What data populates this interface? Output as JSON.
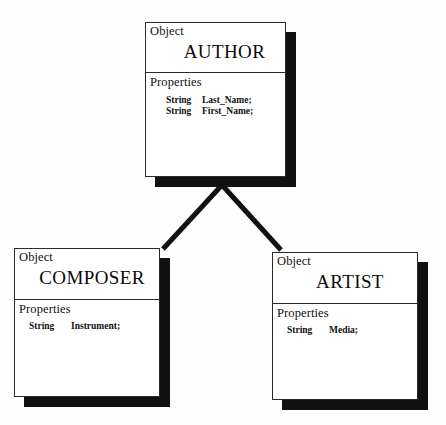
{
  "diagram": {
    "type": "class-diagram",
    "background_color": "#fefefe",
    "line_color": "#111111",
    "box_fill": "#ffffff",
    "border_color": "#2a2a2a",
    "shadow_color": "#111111",
    "classes": [
      {
        "id": "author",
        "stereotype": "Object",
        "name": "AUTHOR",
        "section_label": "Properties",
        "properties": [
          {
            "type": "String",
            "name": "Last_Name;"
          },
          {
            "type": "String",
            "name": "First_Name;"
          }
        ]
      },
      {
        "id": "composer",
        "stereotype": "Object",
        "name": "COMPOSER",
        "section_label": "Properties",
        "properties": [
          {
            "type": "String",
            "name": "Instrument;"
          }
        ]
      },
      {
        "id": "artist",
        "stereotype": "Object",
        "name": "ARTIST",
        "section_label": "Properties",
        "properties": [
          {
            "type": "String",
            "name": "Media;"
          }
        ]
      }
    ],
    "relationships": [
      {
        "from": "composer",
        "to": "author",
        "kind": "generalization"
      },
      {
        "from": "artist",
        "to": "author",
        "kind": "generalization"
      }
    ]
  }
}
